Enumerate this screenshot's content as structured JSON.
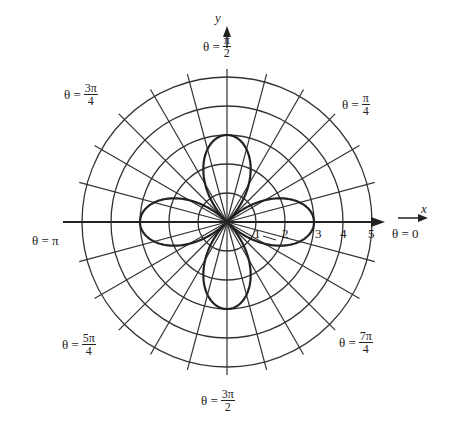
{
  "chart_data": {
    "type": "polar",
    "title": "",
    "curve": {
      "equation": "r = 3 cos(2θ)",
      "description": "four-leaved rose",
      "max_r": 3
    },
    "radial_ticks": [
      "1",
      "2",
      "3",
      "4",
      "5"
    ],
    "r_max": 5,
    "radial_line_step_deg": 15,
    "axes": {
      "x": "x",
      "y": "y"
    },
    "angle_labels": [
      {
        "id": "0",
        "text": "θ = 0",
        "prefix": "θ =",
        "num": "0",
        "den": ""
      },
      {
        "id": "pi4",
        "text": "θ = π/4",
        "prefix": "θ =",
        "num": "π",
        "den": "4"
      },
      {
        "id": "pi2",
        "text": "θ = π/2",
        "prefix": "θ =",
        "num": "π",
        "den": "2"
      },
      {
        "id": "3pi4",
        "text": "θ = 3π/4",
        "prefix": "θ =",
        "num": "3π",
        "den": "4"
      },
      {
        "id": "pi",
        "text": "θ = π",
        "prefix": "θ =",
        "num": "π",
        "den": ""
      },
      {
        "id": "5pi4",
        "text": "θ = 5π/4",
        "prefix": "θ =",
        "num": "5π",
        "den": "4"
      },
      {
        "id": "3pi2",
        "text": "θ = 3π/2",
        "prefix": "θ =",
        "num": "3π",
        "den": "2"
      },
      {
        "id": "7pi4",
        "text": "θ = 7π/4",
        "prefix": "θ =",
        "num": "7π",
        "den": "4"
      }
    ]
  },
  "labels": {
    "x_axis": "x",
    "y_axis": "y",
    "theta0": "θ = 0",
    "thetaPi": "θ = π",
    "prefix": "θ =",
    "pi4": {
      "num": "π",
      "den": "4"
    },
    "pi2": {
      "num": "π",
      "den": "2"
    },
    "3pi4": {
      "num": "3π",
      "den": "4"
    },
    "5pi4": {
      "num": "5π",
      "den": "4"
    },
    "3pi2": {
      "num": "3π",
      "den": "2"
    },
    "7pi4": {
      "num": "7π",
      "den": "4"
    },
    "ticks": [
      "1",
      "2",
      "3",
      "4",
      "5"
    ]
  },
  "colors": {
    "ink": "#222222",
    "grid": "#333333",
    "background": "#ffffff"
  }
}
